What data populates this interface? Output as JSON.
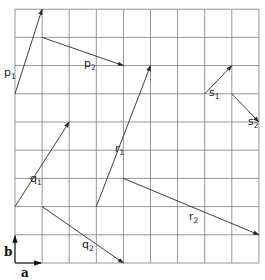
{
  "diagram": {
    "type": "vector-grid",
    "grid": {
      "columns": 9,
      "rows": 9,
      "origin_px": [
        15,
        263
      ],
      "cell_w_px": 27.1,
      "cell_h_px": 28.2,
      "line_color": "#8a8a8a"
    },
    "basis": {
      "a": {
        "label": "a",
        "from": [
          0,
          0
        ],
        "to": [
          1,
          0
        ]
      },
      "b": {
        "label": "b",
        "from": [
          0,
          0
        ],
        "to": [
          0,
          1
        ]
      }
    },
    "vectors": [
      {
        "id": "p1",
        "label": "p",
        "sub": "1",
        "from": [
          0,
          6
        ],
        "to": [
          1,
          9
        ],
        "label_pos": [
          2,
          59
        ]
      },
      {
        "id": "p2",
        "label": "p",
        "sub": "2",
        "from": [
          1,
          8
        ],
        "to": [
          4,
          7
        ],
        "label_pos": [
          82,
          50
        ]
      },
      {
        "id": "q1",
        "label": "q",
        "sub": "1",
        "from": [
          0,
          2
        ],
        "to": [
          2,
          5
        ],
        "label_pos": [
          28,
          165
        ]
      },
      {
        "id": "q2",
        "label": "q",
        "sub": "2",
        "from": [
          1,
          2
        ],
        "to": [
          4,
          0
        ],
        "label_pos": [
          80,
          231
        ]
      },
      {
        "id": "r1",
        "label": "r",
        "sub": "1",
        "from": [
          3,
          2
        ],
        "to": [
          5,
          7
        ],
        "label_pos": [
          113,
          135
        ]
      },
      {
        "id": "r2",
        "label": "r",
        "sub": "2",
        "from": [
          4,
          3
        ],
        "to": [
          9,
          1
        ],
        "label_pos": [
          187,
          203
        ]
      },
      {
        "id": "s1",
        "label": "s",
        "sub": "1",
        "from": [
          7,
          6
        ],
        "to": [
          8,
          7
        ],
        "label_pos": [
          207,
          79
        ]
      },
      {
        "id": "s2",
        "label": "s",
        "sub": "2",
        "from": [
          8,
          6
        ],
        "to": [
          9,
          5
        ],
        "label_pos": [
          246,
          108
        ]
      }
    ],
    "colors": {
      "vector": "#2a2a2a",
      "label": "#222222",
      "background": "#ffffff"
    }
  }
}
